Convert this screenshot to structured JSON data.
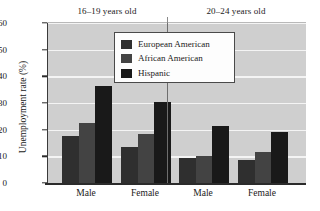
{
  "chart_data": {
    "type": "bar",
    "title": "",
    "xlabel": "",
    "ylabel": "Unemployment rate (%)",
    "ylim": [
      0,
      60
    ],
    "yticks": [
      0,
      10,
      20,
      30,
      40,
      50,
      60
    ],
    "grid": "horizontal",
    "legend_position": "top-center-left",
    "group_titles": [
      "16–19 years old",
      "20–24 years old"
    ],
    "categories": [
      "Male",
      "Female",
      "Male",
      "Female"
    ],
    "category_groups": [
      "16–19 years old",
      "16–19 years old",
      "20–24 years old",
      "20–24 years old"
    ],
    "series": [
      {
        "name": "European American",
        "color": "#2f2f2f",
        "values": [
          17.5,
          13.5,
          9.5,
          8.7
        ]
      },
      {
        "name": "African American",
        "color": "#434343",
        "values": [
          22.5,
          18.5,
          10.3,
          11.5
        ]
      },
      {
        "name": "Hispanic",
        "color": "#191919",
        "values": [
          36.5,
          30.3,
          21.3,
          19.3
        ]
      }
    ]
  },
  "legend": {
    "items": [
      {
        "label": "European American"
      },
      {
        "label": "African American"
      },
      {
        "label": "Hispanic"
      }
    ]
  },
  "axes": {
    "y_title": "Unemployment rate (%)",
    "y_tick_labels": [
      "0",
      "10",
      "20",
      "30",
      "40",
      "50",
      "60"
    ],
    "x_tick_labels": [
      "Male",
      "Female",
      "Male",
      "Female"
    ]
  },
  "colors": {
    "plot_background": "#cfcfcf",
    "gridline": "#f4f4f4",
    "axis": "#2b2b2b",
    "page_background": "#ffffff",
    "legend_background": "#fdfdfd",
    "legend_border": "#4a4a4a",
    "divider": "#6e6e6e"
  }
}
